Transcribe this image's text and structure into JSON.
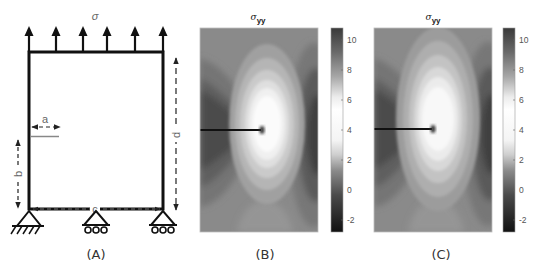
{
  "panelA": {
    "caption": "(A)",
    "load_label": "σ",
    "num_load_arrows": 6,
    "dimensions": {
      "a": "a",
      "b": "b",
      "c": "c",
      "d": "d"
    },
    "supports": [
      "pinned",
      "roller",
      "roller"
    ]
  },
  "panelB": {
    "caption": "(B)",
    "title_symbol": "σ",
    "title_sub": "yy",
    "colorbar": {
      "ticks": [
        "10",
        "8",
        "6",
        "4",
        "2",
        "0",
        "-2"
      ],
      "min": -2.8,
      "max": 10.8
    }
  },
  "panelC": {
    "caption": "(C)",
    "title_symbol": "σ",
    "title_sub": "yy",
    "colorbar": {
      "ticks": [
        "10",
        "8",
        "6",
        "4",
        "2",
        "0",
        "-2"
      ],
      "min": -2.8,
      "max": 10.8
    }
  },
  "colors": {
    "line": "#111111",
    "dim": "#777777",
    "field_base": "#8a8a8a",
    "field_bright": "#f6f6f6",
    "field_dark": "#3c3c3c"
  }
}
